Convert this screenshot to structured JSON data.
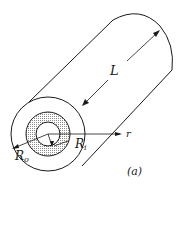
{
  "figure": {
    "labels": {
      "length": "L",
      "radial_axis": "r",
      "outer_radius_main": "R",
      "outer_radius_sub": "o",
      "inner_radius_main": "R",
      "inner_radius_sub": "i",
      "panel": "(a)"
    },
    "colors": {
      "stroke": "#1a1a1a",
      "hatch": "#9a9a9a",
      "background": "#ffffff"
    }
  }
}
